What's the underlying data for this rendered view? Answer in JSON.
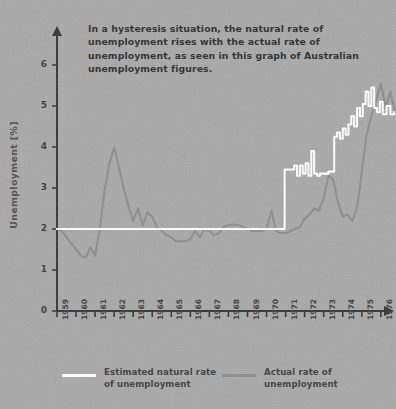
{
  "caption": "In a hysteresis situation, the natural rate of unemployment rises with the actual rate of unemployment, as seen in this graph of Australian unemployment figures.",
  "legend": {
    "natural": {
      "label": "Estimated natural rate of unemployment",
      "color": "#ffffff"
    },
    "actual": {
      "label": "Actual rate of unemployment",
      "color": "#8c8c8c"
    }
  },
  "colors": {
    "background": "#a8a8a8",
    "axis": "#333333",
    "text": "#3a3a3a",
    "caption_text": "#2b2b2b",
    "natural_line": "#ffffff",
    "actual_line": "#8c8c8c"
  },
  "chart_data": {
    "type": "line",
    "title": "",
    "xlabel": "",
    "ylabel": "Unemployment [%]",
    "xlim": [
      1959,
      1976.75
    ],
    "ylim": [
      0,
      6.6
    ],
    "yticks": [
      0,
      1,
      2,
      3,
      4,
      5,
      6
    ],
    "ytick_labels": [
      "0",
      "1",
      "2",
      "3",
      "4",
      "5",
      "6"
    ],
    "xticks": [
      1959,
      1960,
      1961,
      1962,
      1963,
      1964,
      1965,
      1966,
      1967,
      1968,
      1969,
      1970,
      1971,
      1972,
      1973,
      1974,
      1975,
      1976
    ],
    "xtick_labels": [
      "1959",
      "1960",
      "1961",
      "1962",
      "1963",
      "1964",
      "1965",
      "1966",
      "1967",
      "1968",
      "1969",
      "1970",
      "1971",
      "1972",
      "1973",
      "1974",
      "1975",
      "1976"
    ],
    "grid": false,
    "legend_position": "below",
    "series": [
      {
        "name": "Estimated natural rate of unemployment",
        "color": "#ffffff",
        "style": "step",
        "x": [
          1959.0,
          1970.9,
          1970.95,
          1971.3,
          1971.45,
          1971.6,
          1971.75,
          1971.9,
          1972.05,
          1972.2,
          1972.35,
          1972.5,
          1972.65,
          1972.8,
          1972.95,
          1973.1,
          1973.25,
          1973.4,
          1973.55,
          1973.7,
          1973.85,
          1974.0,
          1974.15,
          1974.3,
          1974.45,
          1974.6,
          1974.75,
          1974.9,
          1975.05,
          1975.2,
          1975.35,
          1975.5,
          1975.65,
          1975.8,
          1975.95,
          1976.1,
          1976.3,
          1976.5,
          1976.7
        ],
        "y": [
          2.0,
          2.0,
          3.45,
          3.45,
          3.55,
          3.3,
          3.55,
          3.35,
          3.6,
          3.3,
          3.9,
          3.35,
          3.3,
          3.35,
          3.35,
          3.35,
          3.4,
          3.4,
          4.25,
          4.35,
          4.2,
          4.45,
          4.3,
          4.55,
          4.75,
          4.5,
          4.95,
          4.75,
          5.05,
          5.35,
          5.0,
          5.45,
          4.95,
          4.85,
          5.1,
          4.8,
          5.0,
          4.8,
          4.85
        ]
      },
      {
        "name": "Actual rate of unemployment",
        "color": "#8c8c8c",
        "style": "line",
        "x": [
          1959.0,
          1959.25,
          1959.5,
          1959.75,
          1960.0,
          1960.25,
          1960.5,
          1960.75,
          1961.0,
          1961.25,
          1961.5,
          1961.75,
          1962.0,
          1962.25,
          1962.5,
          1962.75,
          1963.0,
          1963.25,
          1963.5,
          1963.75,
          1964.0,
          1964.25,
          1964.5,
          1964.75,
          1965.0,
          1965.25,
          1965.5,
          1965.75,
          1966.0,
          1966.25,
          1966.5,
          1966.75,
          1967.0,
          1967.25,
          1967.5,
          1967.75,
          1968.0,
          1968.25,
          1968.5,
          1968.75,
          1969.0,
          1969.25,
          1969.5,
          1969.75,
          1970.0,
          1970.25,
          1970.5,
          1970.75,
          1971.0,
          1971.25,
          1971.5,
          1971.75,
          1972.0,
          1972.25,
          1972.5,
          1972.75,
          1973.0,
          1973.25,
          1973.5,
          1973.75,
          1974.0,
          1974.25,
          1974.5,
          1974.75,
          1975.0,
          1975.25,
          1975.5,
          1975.75,
          1976.0,
          1976.25,
          1976.5,
          1976.75
        ],
        "y": [
          2.0,
          1.95,
          1.8,
          1.65,
          1.5,
          1.35,
          1.3,
          1.55,
          1.35,
          2.0,
          2.95,
          3.6,
          4.0,
          3.5,
          3.0,
          2.55,
          2.2,
          2.5,
          2.1,
          2.4,
          2.3,
          2.05,
          1.95,
          1.85,
          1.8,
          1.7,
          1.7,
          1.7,
          1.75,
          1.95,
          1.8,
          2.0,
          1.95,
          1.85,
          1.9,
          2.05,
          2.1,
          2.1,
          2.1,
          2.05,
          2.0,
          1.95,
          1.95,
          1.95,
          2.0,
          2.45,
          1.95,
          1.9,
          1.9,
          1.95,
          2.0,
          2.05,
          2.25,
          2.35,
          2.5,
          2.45,
          2.75,
          3.3,
          3.2,
          2.65,
          2.3,
          2.35,
          2.2,
          2.5,
          3.4,
          4.3,
          4.75,
          5.15,
          5.55,
          4.95,
          5.35,
          4.85
        ]
      }
    ]
  }
}
